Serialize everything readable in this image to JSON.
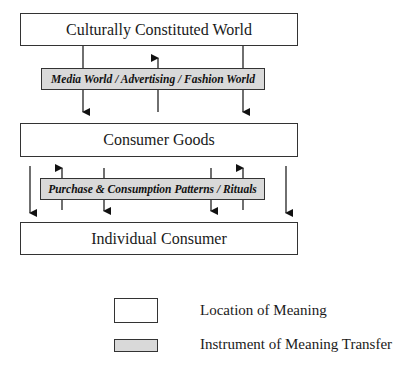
{
  "diagram": {
    "locations": {
      "top": "Culturally Constituted World",
      "middle": "Consumer Goods",
      "bottom": "Individual Consumer"
    },
    "instruments": {
      "first": "Media World / Advertising / Fashion World",
      "second": "Purchase & Consumption Patterns / Rituals"
    },
    "flows": [
      {
        "from": "Culturally Constituted World",
        "to": "Consumer Goods",
        "direction": "down"
      },
      {
        "from": "Consumer Goods",
        "to": "Culturally Constituted World",
        "direction": "up"
      },
      {
        "from": "Culturally Constituted World",
        "to": "Consumer Goods",
        "direction": "down"
      },
      {
        "from": "Consumer Goods",
        "to": "Individual Consumer",
        "direction": "down"
      },
      {
        "from": "Individual Consumer",
        "to": "Consumer Goods",
        "direction": "up"
      },
      {
        "from": "Consumer Goods",
        "to": "Individual Consumer",
        "direction": "down"
      },
      {
        "from": "Consumer Goods",
        "to": "Individual Consumer",
        "direction": "down"
      },
      {
        "from": "Individual Consumer",
        "to": "Consumer Goods",
        "direction": "up"
      },
      {
        "from": "Consumer Goods",
        "to": "Individual Consumer",
        "direction": "down"
      }
    ]
  },
  "legend": {
    "location": "Location of Meaning",
    "instrument": "Instrument of Meaning Transfer"
  }
}
